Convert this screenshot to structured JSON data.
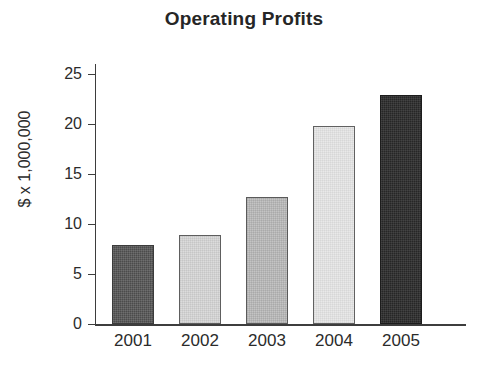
{
  "chart_data": {
    "type": "bar",
    "title": "Operating Profits",
    "xlabel": "",
    "ylabel": "$ x 1,000,000",
    "categories": [
      "2001",
      "2002",
      "2003",
      "2004",
      "2005"
    ],
    "values": [
      7.9,
      8.9,
      12.7,
      19.8,
      22.9
    ],
    "ylim": [
      0,
      25
    ],
    "yticks": [
      "0",
      "5",
      "10",
      "15",
      "20",
      "25"
    ],
    "ytick_values": [
      0,
      5,
      10,
      15,
      20,
      25
    ],
    "grid": false,
    "legend": false,
    "bar_fills": [
      "#4b4b4b",
      "#dcdcdc",
      "#c4c4c4",
      "#e9e9e9",
      "#262626"
    ],
    "bar_fill_names": [
      "dark-gray",
      "light-gray",
      "medium-gray",
      "pale-gray",
      "near-black"
    ],
    "axis_color": "#3d3d3d",
    "background": "#ffffff"
  }
}
